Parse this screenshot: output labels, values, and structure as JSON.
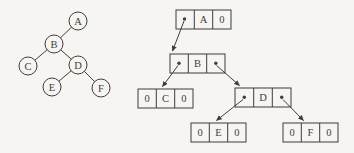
{
  "colors": {
    "ink": "#3d3d3d",
    "paper": "#f6f5f1"
  },
  "tree": {
    "a": "A",
    "b": "B",
    "c": "C",
    "d": "D",
    "e": "E",
    "f": "F"
  },
  "linked": {
    "a": {
      "data": "A",
      "rchild": "0"
    },
    "b": {
      "data": "B"
    },
    "c": {
      "lchild": "0",
      "data": "C",
      "rchild": "0"
    },
    "d": {
      "data": "D"
    },
    "e": {
      "lchild": "0",
      "data": "E",
      "rchild": "0"
    },
    "f": {
      "lchild": "0",
      "data": "F",
      "rchild": "0"
    }
  }
}
